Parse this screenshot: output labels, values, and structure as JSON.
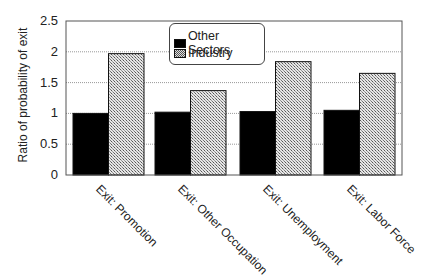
{
  "chart_data": {
    "type": "bar",
    "title": "",
    "xlabel": "",
    "ylabel": "Ratio of probability of exit",
    "ylim": [
      0,
      2.5
    ],
    "yticks": [
      "0",
      "0.5",
      "1",
      "1.5",
      "2",
      "2.5"
    ],
    "grid": "horizontal dotted",
    "legend_position": "top center (inside)",
    "categories": [
      "Exit: Promotion",
      "Exit: Other Occupation",
      "Exit: Unemployment",
      "Exit: Labor Force"
    ],
    "series": [
      {
        "name": "Other Sectors",
        "values": [
          1.0,
          1.02,
          1.03,
          1.05
        ],
        "color": "#000000",
        "pattern": "solid"
      },
      {
        "name": "Industry",
        "values": [
          1.97,
          1.37,
          1.84,
          1.65
        ],
        "color": "#bbbbbb",
        "pattern": "checkered"
      }
    ]
  },
  "axis": {
    "ylabel": "Ratio of probability of exit",
    "ticks": [
      "0",
      "0.5",
      "1",
      "1.5",
      "2",
      "2.5"
    ]
  },
  "legend": {
    "items": [
      {
        "label": "Other Sectors"
      },
      {
        "label": "Industry"
      }
    ]
  }
}
